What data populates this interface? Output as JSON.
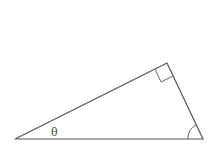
{
  "diagram": {
    "type": "right-triangle",
    "vertices": {
      "left": [
        15,
        139
      ],
      "top_right": [
        167,
        63
      ],
      "bottom_right": [
        203,
        139
      ]
    },
    "labels": {
      "angle_left": "θ"
    },
    "markers": {
      "right_angle_at": "top_right",
      "angle_arc_at": "bottom_right"
    },
    "colors": {
      "stroke": "#555555",
      "background": "#ffffff"
    }
  }
}
